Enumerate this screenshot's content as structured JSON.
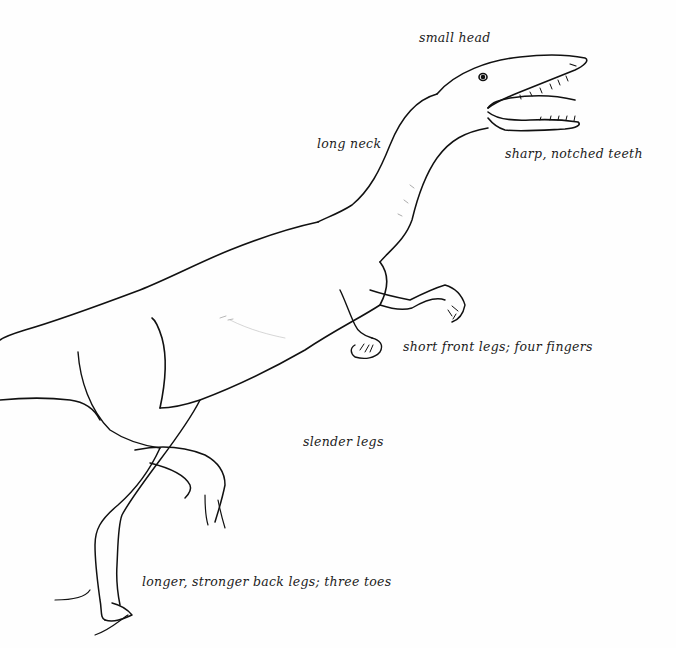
{
  "figure": {
    "background_color": "#fefefe",
    "line_color": "#111111",
    "label_color": "#1c1c1c"
  },
  "labels": [
    {
      "id": "small-head",
      "text": "small head",
      "x": 419,
      "y": 30
    },
    {
      "id": "long-neck",
      "text": "long neck",
      "x": 317,
      "y": 136
    },
    {
      "id": "teeth",
      "text": "sharp, notched teeth",
      "x": 505,
      "y": 146
    },
    {
      "id": "front-legs",
      "text": "short front legs; four fingers",
      "x": 403,
      "y": 339
    },
    {
      "id": "slender-legs",
      "text": "slender legs",
      "x": 303,
      "y": 434
    },
    {
      "id": "back-legs",
      "text": "longer, stronger back legs; three toes",
      "x": 142,
      "y": 574
    }
  ]
}
